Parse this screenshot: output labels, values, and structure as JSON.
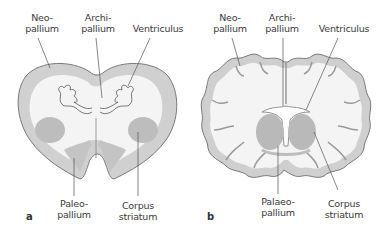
{
  "figure": {
    "panels": [
      {
        "letter": "a",
        "labels": {
          "neopallium": "Neo-\npallium",
          "archipallium": "Archi-\npallium",
          "ventriculus": "Ventriculus",
          "paleopallium": "Paleo-\npallium",
          "corpus_striatum": "Corpus\nstriatum"
        }
      },
      {
        "letter": "b",
        "labels": {
          "neopallium": "Neo-\npallium",
          "archipallium": "Archi-\npallium",
          "ventriculus": "Ventriculus",
          "palaeopallium": "Palaeo-\npallium",
          "corpus_striatum": "Corpus\nstriatum"
        }
      }
    ],
    "colors": {
      "outline": "#7a7a7a",
      "cortex": "#cfcfcf",
      "white_matter": "#f3f3f3",
      "nuclei": "#b8b8b8",
      "leader": "#555555"
    }
  }
}
